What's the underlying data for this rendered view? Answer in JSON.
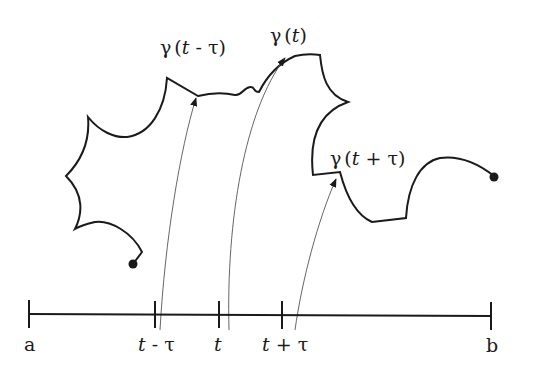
{
  "figure": {
    "curve_labels": [
      {
        "id": "gamma-t-minus-tau",
        "text": "γ(t - τ)",
        "greek": "γ",
        "open": "(",
        "var": "t",
        "op": " - ",
        "tau": "τ",
        "close": ")"
      },
      {
        "id": "gamma-t",
        "text": "γ(t)",
        "greek": "γ",
        "open": "(",
        "var": "t",
        "close": ")"
      },
      {
        "id": "gamma-t-plus-tau",
        "text": "γ(t + τ)",
        "greek": "γ",
        "open": "(",
        "var": "t",
        "op": " + ",
        "tau": "τ",
        "close": ")"
      }
    ],
    "axis": {
      "start_label": "a",
      "end_label": "b",
      "ticks": [
        {
          "var": "t",
          "op": " - ",
          "tau": "τ"
        },
        {
          "var": "t",
          "op": "",
          "tau": ""
        },
        {
          "var": "t",
          "op": " + ",
          "tau": "τ"
        }
      ]
    },
    "colors": {
      "curve": "#1a1a1a",
      "arrow": "#555555"
    }
  }
}
